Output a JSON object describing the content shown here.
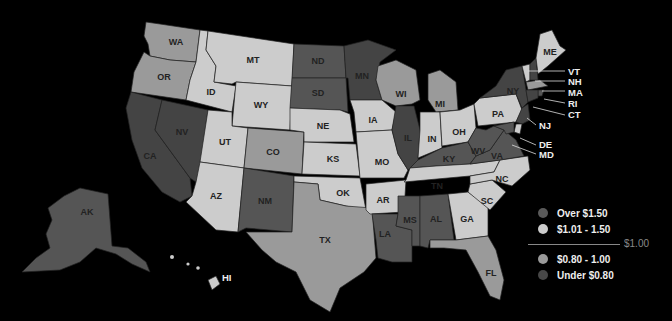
{
  "colors": {
    "over_150": "#555555",
    "r101_150": "#cccccc",
    "r080_100": "#9a9a9a",
    "under_080": "#444444",
    "background": "#000000"
  },
  "legend": {
    "items": [
      {
        "label": "Over $1.50",
        "color": "#5a5a5a"
      },
      {
        "label": "$1.01 - 1.50",
        "color": "#cccccc"
      },
      {
        "label": "$0.80 - 1.00",
        "color": "#9a9a9a"
      },
      {
        "label": "Under $0.80",
        "color": "#474747"
      }
    ],
    "divider_label": "$1.00"
  },
  "states": {
    "WA": {
      "label": "WA",
      "category": "$0.80 - 1.00"
    },
    "OR": {
      "label": "OR",
      "category": "$0.80 - 1.00"
    },
    "CA": {
      "label": "CA",
      "category": "Under $0.80"
    },
    "NV": {
      "label": "NV",
      "category": "Under $0.80"
    },
    "ID": {
      "label": "ID",
      "category": "$1.01 - 1.50"
    },
    "MT": {
      "label": "MT",
      "category": "$1.01 - 1.50"
    },
    "WY": {
      "label": "WY",
      "category": "$1.01 - 1.50"
    },
    "UT": {
      "label": "UT",
      "category": "$1.01 - 1.50"
    },
    "AZ": {
      "label": "AZ",
      "category": "$1.01 - 1.50"
    },
    "CO": {
      "label": "CO",
      "category": "$0.80 - 1.00"
    },
    "NM": {
      "label": "NM",
      "category": "Over $1.50"
    },
    "ND": {
      "label": "ND",
      "category": "Over $1.50"
    },
    "SD": {
      "label": "SD",
      "category": "Over $1.50"
    },
    "NE": {
      "label": "NE",
      "category": "$1.01 - 1.50"
    },
    "KS": {
      "label": "KS",
      "category": "$1.01 - 1.50"
    },
    "OK": {
      "label": "OK",
      "category": "$1.01 - 1.50"
    },
    "TX": {
      "label": "TX",
      "category": "$0.80 - 1.00"
    },
    "MN": {
      "label": "MN",
      "category": "Under $0.80"
    },
    "IA": {
      "label": "IA",
      "category": "$1.01 - 1.50"
    },
    "MO": {
      "label": "MO",
      "category": "$1.01 - 1.50"
    },
    "AR": {
      "label": "AR",
      "category": "$1.01 - 1.50"
    },
    "LA": {
      "label": "LA",
      "category": "Over $1.50"
    },
    "WI": {
      "label": "WI",
      "category": "$0.80 - 1.00"
    },
    "IL": {
      "label": "IL",
      "category": "Under $0.80"
    },
    "MI": {
      "label": "MI",
      "category": "$0.80 - 1.00"
    },
    "IN": {
      "label": "IN",
      "category": "$1.01 - 1.50"
    },
    "OH": {
      "label": "OH",
      "category": "$1.01 - 1.50"
    },
    "KY": {
      "label": "KY",
      "category": "Over $1.50"
    },
    "TN": {
      "label": "TN",
      "category": "$1.01 - 1.50"
    },
    "MS": {
      "label": "MS",
      "category": "Over $1.50"
    },
    "AL": {
      "label": "AL",
      "category": "Over $1.50"
    },
    "GA": {
      "label": "GA",
      "category": "$1.01 - 1.50"
    },
    "FL": {
      "label": "FL",
      "category": "$0.80 - 1.00"
    },
    "SC": {
      "label": "SC",
      "category": "$1.01 - 1.50"
    },
    "NC": {
      "label": "NC",
      "category": "$1.01 - 1.50"
    },
    "VA": {
      "label": "VA",
      "category": "Over $1.50"
    },
    "WV": {
      "label": "WV",
      "category": "Over $1.50"
    },
    "PA": {
      "label": "PA",
      "category": "$1.01 - 1.50"
    },
    "NY": {
      "label": "NY",
      "category": "Under $0.80"
    },
    "ME": {
      "label": "ME",
      "category": "$1.01 - 1.50"
    },
    "VT": {
      "label": "VT",
      "category": "$1.01 - 1.50"
    },
    "NH": {
      "label": "NH",
      "category": "Under $0.80"
    },
    "MA": {
      "label": "MA",
      "category": "$0.80 - 1.00"
    },
    "RI": {
      "label": "RI",
      "category": "Over $1.50"
    },
    "CT": {
      "label": "CT",
      "category": "Under $0.80"
    },
    "NJ": {
      "label": "NJ",
      "category": "Under $0.80"
    },
    "DE": {
      "label": "DE",
      "category": "$1.01 - 1.50"
    },
    "MD": {
      "label": "MD",
      "category": "Over $1.50"
    },
    "AK": {
      "label": "AK",
      "category": "Over $1.50"
    },
    "HI": {
      "label": "HI",
      "category": "$1.01 - 1.50"
    }
  }
}
